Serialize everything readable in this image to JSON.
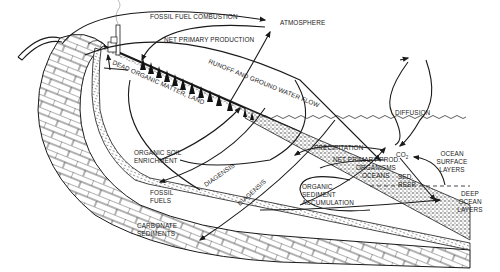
{
  "diagram": {
    "colors": {
      "ink": "#1a1a1a",
      "background": "#ffffff"
    },
    "labels": {
      "fossil_fuel_combustion": "FOSSIL FUEL COMBUSTION",
      "atmosphere": "ATMOSPHERE",
      "net_primary_production": "NET PRIMARY PRODUCTION",
      "runoff": "RUNOFF AND GROUND WATER FLOW",
      "dead_organic_matter": "DEAD ORGANIC MATTER, LAND",
      "diffusion": "DIFFUSION",
      "organic_soil_1": "ORGANIC SOIL",
      "organic_soil_2": "ENRICHMENT",
      "precipitation": "PRECIPITATION",
      "co2_main": "CO",
      "co2_sub": "2",
      "ocean_surface_1": "OCEAN",
      "ocean_surface_2": "SURFACE",
      "ocean_surface_3": "LAYERS",
      "net_primary_prod_ocean": "NET PRIMARY PROD.",
      "organisms_1": "ORGANISMS",
      "organisms_2": "OCEANS",
      "sed_resp_1": "SED.",
      "sed_resp_2": "RESP.",
      "deep_ocean_1": "DEEP",
      "deep_ocean_2": "OCEAN",
      "deep_ocean_3": "LAYERS",
      "diagenesis_1": "DIAGENSIS",
      "diagenesis_2": "DIAGENSIS",
      "fossil_fuels_1": "FOSSIL",
      "fossil_fuels_2": "FUELS",
      "organic_sediment_1": "ORGANIC",
      "organic_sediment_2": "SEDIMENT",
      "organic_sediment_3": "ACCUMULATION",
      "carbonate_1": "CARBONATE",
      "carbonate_2": "SEDIMENTS"
    }
  }
}
